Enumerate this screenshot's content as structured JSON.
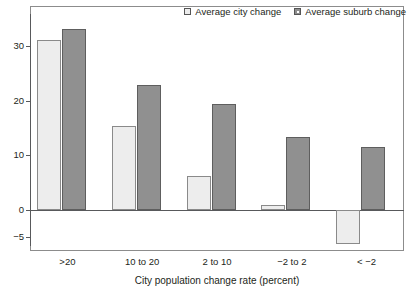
{
  "top_sliver_text": "",
  "legend": {
    "position": "top-right",
    "entries": [
      {
        "label": "Average city change",
        "swatch": "city-swatch",
        "color": "#ededed"
      },
      {
        "label": "Average suburb change",
        "swatch": "suburb-swatch",
        "color": "#909090"
      }
    ]
  },
  "chart_data": {
    "type": "bar",
    "title": "",
    "xlabel": "City population change rate (percent)",
    "ylabel": "",
    "categories": [
      ">20",
      "10 to 20",
      "2 to 10",
      "−2 to 2",
      "< −2"
    ],
    "series": [
      {
        "name": "Average city change",
        "values": [
          31,
          15.3,
          6.2,
          1,
          -6.3
        ],
        "color": "#ededed"
      },
      {
        "name": "Average suburb change",
        "values": [
          33,
          22.8,
          19.3,
          13.4,
          11.5
        ],
        "color": "#909090"
      }
    ],
    "yticks": [
      30,
      20,
      10,
      0,
      -5
    ],
    "ytick_labels": [
      "30",
      "20",
      "10",
      "0",
      "−5"
    ],
    "ylim": [
      -8,
      36
    ],
    "grid": false,
    "legend_position": "top-right",
    "zero_line": true,
    "orientation": "vertical",
    "grouping": "grouped"
  }
}
